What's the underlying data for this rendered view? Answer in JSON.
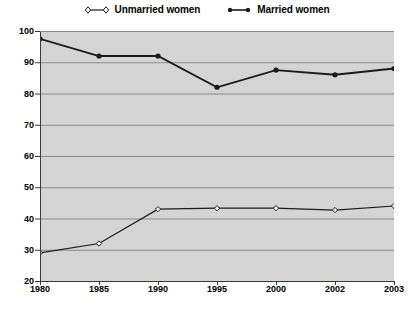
{
  "chart_data": {
    "type": "line",
    "title": "",
    "subtitle": "",
    "xlabel": "",
    "ylabel": "",
    "categories": [
      "1980",
      "1985",
      "1990",
      "1995",
      "2000",
      "2002",
      "2003"
    ],
    "ylim": [
      20,
      100
    ],
    "yticks": [
      20,
      30,
      40,
      50,
      60,
      70,
      80,
      90,
      100
    ],
    "grid": true,
    "grid_axis": "y",
    "legend_position": "top-center",
    "series": [
      {
        "name": "Unmarried women",
        "marker": "open-diamond",
        "color": "#1a1a1a",
        "values": [
          29,
          32,
          43,
          43.3,
          43.3,
          42.7,
          44
        ]
      },
      {
        "name": "Married women",
        "marker": "filled-circle",
        "color": "#1a1a1a",
        "values": [
          97.5,
          92,
          92,
          82,
          87.5,
          86,
          88
        ]
      }
    ]
  },
  "legend": {
    "entries": [
      {
        "label": "Unmarried women",
        "marker": "open-diamond-icon"
      },
      {
        "label": "Married women",
        "marker": "filled-circle-icon"
      }
    ]
  },
  "colors": {
    "plot_background": "#d4d4d4",
    "gridline": "#8a8a8a",
    "axis": "#3a3a3a",
    "series": "#1a1a1a",
    "page_background": "#ffffff"
  }
}
